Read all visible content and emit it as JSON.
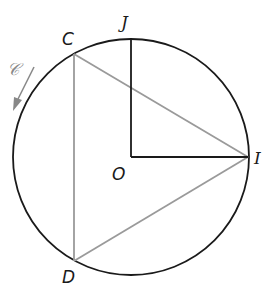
{
  "diagram": {
    "type": "geometry",
    "colors": {
      "circle": "#1a1a1a",
      "radii": "#1a1a1a",
      "triangle": "#9a9a9a",
      "arrow": "#888888",
      "background": "#ffffff"
    },
    "points": {
      "O": {
        "label": "O",
        "x": 131,
        "y": 157
      },
      "I": {
        "label": "I",
        "x": 248,
        "y": 157
      },
      "J": {
        "label": "J",
        "x": 131,
        "y": 38
      },
      "C": {
        "label": "C",
        "x": 74,
        "y": 54
      },
      "D": {
        "label": "D",
        "x": 74,
        "y": 261
      }
    },
    "circle": {
      "name": "circle",
      "cx": 131,
      "cy": 157,
      "r": 118
    },
    "segments": [
      {
        "from": "O",
        "to": "J",
        "style": "radius"
      },
      {
        "from": "O",
        "to": "I",
        "style": "radius"
      },
      {
        "from": "C",
        "to": "I",
        "style": "triangle"
      },
      {
        "from": "C",
        "to": "D",
        "style": "triangle"
      },
      {
        "from": "D",
        "to": "I",
        "style": "triangle"
      }
    ],
    "orientation": {
      "label": "𝒞",
      "direction": "counterclockwise"
    }
  }
}
